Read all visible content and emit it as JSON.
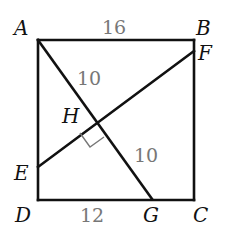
{
  "diagram": {
    "type": "geometry",
    "shape": "square ABCD",
    "points": {
      "A": {
        "label": "A",
        "x": 38,
        "y": 40,
        "label_x": 14,
        "label_y": 35
      },
      "B": {
        "label": "B",
        "x": 194,
        "y": 40,
        "label_x": 196,
        "label_y": 35
      },
      "C": {
        "label": "C",
        "x": 194,
        "y": 200,
        "label_x": 193,
        "label_y": 222
      },
      "D": {
        "label": "D",
        "x": 38,
        "y": 200,
        "label_x": 15,
        "label_y": 222
      },
      "E": {
        "label": "E",
        "x": 38,
        "y": 167,
        "label_x": 14,
        "label_y": 180
      },
      "F": {
        "label": "F",
        "x": 194,
        "y": 51,
        "label_x": 198,
        "label_y": 60
      },
      "G": {
        "label": "G",
        "x": 152,
        "y": 199,
        "label_x": 143,
        "label_y": 222
      },
      "H": {
        "label": "H",
        "x": 97,
        "y": 120,
        "label_x": 62,
        "label_y": 123
      }
    },
    "segments": [
      {
        "from": "A",
        "to": "B"
      },
      {
        "from": "B",
        "to": "C"
      },
      {
        "from": "C",
        "to": "D"
      },
      {
        "from": "D",
        "to": "A"
      },
      {
        "from": "A",
        "to": "G"
      },
      {
        "from": "E",
        "to": "F"
      }
    ],
    "lengths": [
      {
        "text": "16",
        "segment": "AB",
        "x": 102,
        "y": 34
      },
      {
        "text": "10",
        "segment": "AH",
        "x": 77,
        "y": 85
      },
      {
        "text": "10",
        "segment": "HG",
        "x": 134,
        "y": 162
      },
      {
        "text": "12",
        "segment": "DG",
        "x": 80,
        "y": 222
      }
    ],
    "right_angle": {
      "at": "H",
      "between": [
        "HE",
        "HG"
      ]
    },
    "colors": {
      "lines": "#111111",
      "measure_labels": "#777777",
      "marker": "#777777"
    }
  }
}
